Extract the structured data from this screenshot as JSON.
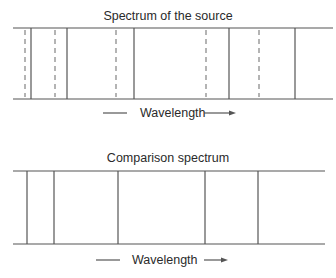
{
  "panels": [
    {
      "id": "source",
      "title": "Spectrum  of  the  source",
      "axis_label": "Wavelength",
      "frame": {
        "x1": 13,
        "x2": 333,
        "y_top": 28,
        "y_bottom": 99
      },
      "solid_lines_x": [
        31,
        67,
        134,
        229,
        295
      ],
      "dashed_lines_x": [
        25,
        55,
        116,
        206,
        259
      ],
      "title_y": 20,
      "label_y": 117,
      "arrow": {
        "left_dash_x1": 103,
        "left_dash_x2": 127,
        "label_x": 140,
        "right_x1": 204,
        "right_x2": 236
      }
    },
    {
      "id": "comparison",
      "title": "Comparison spectrum",
      "axis_label": "Wavelength",
      "frame": {
        "x1": 13,
        "x2": 325,
        "y_top": 171,
        "y_bottom": 244
      },
      "solid_lines_x": [
        27,
        54,
        118,
        205,
        258
      ],
      "dashed_lines_x": [],
      "title_y": 162,
      "label_y": 264,
      "arrow": {
        "left_dash_x1": 96,
        "left_dash_x2": 120,
        "label_x": 132,
        "right_x1": 204,
        "right_x2": 228
      }
    }
  ],
  "colors": {
    "line": "#555555",
    "dashed": "#777777",
    "text": "#2a2a2a"
  }
}
